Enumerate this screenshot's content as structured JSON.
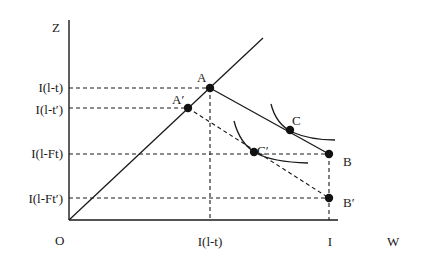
{
  "diagram": {
    "axes": {
      "y_label": "Z",
      "x_label": "W",
      "origin_label": "O"
    },
    "y_ticks": [
      "I(l-t)",
      "I(l-t′)",
      "I(l-Ft)",
      "I(l-Ft′)"
    ],
    "x_ticks": [
      "I(l-t)",
      "I"
    ],
    "points": {
      "A": "A",
      "A_prime": "A′",
      "B": "B",
      "B_prime": "B′",
      "C": "C",
      "C_prime": "C′"
    },
    "lines": [
      {
        "name": "45-degree line",
        "style": "solid",
        "from": "O"
      },
      {
        "name": "budget line AB",
        "style": "solid",
        "from": "A",
        "to": "B"
      },
      {
        "name": "budget line A'B'",
        "style": "dashed",
        "from": "A′",
        "to": "B′"
      },
      {
        "name": "indifference curve at C",
        "style": "solid"
      },
      {
        "name": "indifference curve at C'",
        "style": "solid"
      }
    ],
    "colors": {
      "ink": "#1a1a1a",
      "background": "#ffffff"
    }
  }
}
